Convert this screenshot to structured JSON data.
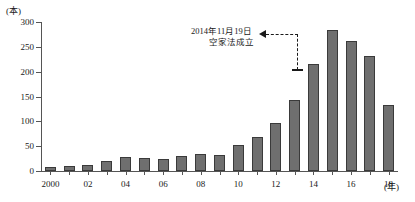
{
  "chart_data": {
    "type": "bar",
    "title": "",
    "xlabel": "(年)",
    "ylabel": "(本)",
    "ylim": [
      0,
      300
    ],
    "ytick_values": [
      0,
      50,
      100,
      150,
      200,
      250,
      300
    ],
    "ytick_labels": [
      "0",
      "50",
      "100",
      "150",
      "200",
      "250",
      "300"
    ],
    "grid": false,
    "legend": null,
    "categories": [
      "2000",
      "2001",
      "2002",
      "2003",
      "2004",
      "2005",
      "2006",
      "2007",
      "2008",
      "2009",
      "2010",
      "2011",
      "2012",
      "2013",
      "2014",
      "2015",
      "2016",
      "2017",
      "2018"
    ],
    "xtick_labels": [
      {
        "category": "2000",
        "label": "2000"
      },
      {
        "category": "2002",
        "label": "02"
      },
      {
        "category": "2004",
        "label": "04"
      },
      {
        "category": "2006",
        "label": "06"
      },
      {
        "category": "2008",
        "label": "08"
      },
      {
        "category": "2010",
        "label": "10"
      },
      {
        "category": "2012",
        "label": "12"
      },
      {
        "category": "2014",
        "label": "14"
      },
      {
        "category": "2016",
        "label": "16"
      },
      {
        "category": "2018",
        "label": "18"
      }
    ],
    "values": [
      8,
      11,
      13,
      21,
      29,
      26,
      25,
      31,
      34,
      32,
      52,
      68,
      96,
      143,
      215,
      283,
      262,
      231,
      133
    ],
    "bar_color": "#6f6f6f",
    "bar_edge_color": "#3a3a3a",
    "annotations": [
      {
        "line1": "2014年11月19日",
        "line2": "空家法成立",
        "points_to_category": "2014",
        "arrow": "left-arrow-dashed"
      }
    ]
  },
  "axis": {
    "y_unit": "(本)",
    "x_unit": "(年)"
  }
}
